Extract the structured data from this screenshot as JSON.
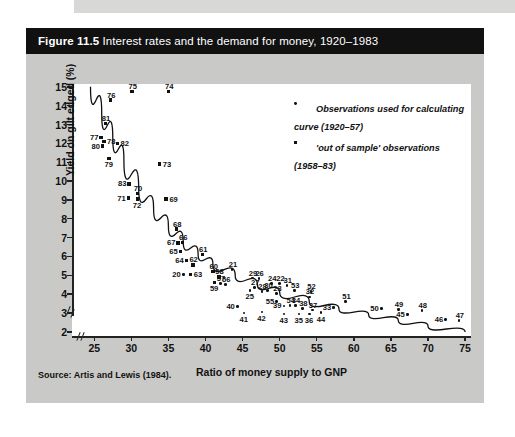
{
  "figure": {
    "number_label": "Figure 11.5",
    "title": "Interest rates and the demand for money, 1920–1983",
    "source": "Source: Artis and Lewis (1984)."
  },
  "legend": {
    "items": [
      {
        "marker": "dot",
        "text": "Observations used for calculating curve (1920–57)"
      },
      {
        "marker": "square",
        "text": "'out of sample' observations (1958–83)"
      }
    ]
  },
  "chart_data": {
    "type": "scatter",
    "title": "Interest rates and the demand for money, 1920–1983",
    "xlabel": "Ratio of money supply to GNP",
    "ylabel": "Yield on gilt edged (%)",
    "xlim": [
      22,
      75
    ],
    "ylim": [
      1.8,
      15
    ],
    "xticks": [
      25,
      30,
      35,
      40,
      45,
      50,
      55,
      60,
      65,
      70,
      75
    ],
    "yticks": [
      2,
      3,
      4,
      5,
      6,
      7,
      8,
      9,
      10,
      11,
      12,
      13,
      14,
      15
    ],
    "grid": false,
    "axis_break_x": true,
    "axis_break_y": true,
    "legend_position": "top-right",
    "series": [
      {
        "name": "Observations used for calculating curve (1920–57)",
        "marker": "dot",
        "points": [
          {
            "label": "20",
            "x": 37.0,
            "y": 5.05
          },
          {
            "label": "21",
            "x": 43.6,
            "y": 5.3
          },
          {
            "label": "22",
            "x": 50.0,
            "y": 4.55
          },
          {
            "label": "23",
            "x": 49.6,
            "y": 4.05
          },
          {
            "label": "24",
            "x": 48.9,
            "y": 4.58
          },
          {
            "label": "25",
            "x": 46.0,
            "y": 4.2
          },
          {
            "label": "26",
            "x": 47.2,
            "y": 4.82
          },
          {
            "label": "27",
            "x": 46.6,
            "y": 4.35
          },
          {
            "label": "28",
            "x": 47.6,
            "y": 4.15
          },
          {
            "label": "29",
            "x": 46.3,
            "y": 4.85
          },
          {
            "label": "30",
            "x": 48.4,
            "y": 4.18
          },
          {
            "label": "31",
            "x": 51.0,
            "y": 4.45
          },
          {
            "label": "32",
            "x": 54.0,
            "y": 3.85
          },
          {
            "label": "33",
            "x": 57.3,
            "y": 3.3
          },
          {
            "label": "34",
            "x": 52.1,
            "y": 3.4
          },
          {
            "label": "35",
            "x": 52.6,
            "y": 2.95
          },
          {
            "label": "36",
            "x": 54.0,
            "y": 2.95
          },
          {
            "label": "37",
            "x": 54.4,
            "y": 3.15
          },
          {
            "label": "38",
            "x": 53.1,
            "y": 3.25
          },
          {
            "label": "39",
            "x": 50.6,
            "y": 3.38
          },
          {
            "label": "40",
            "x": 44.3,
            "y": 3.35
          },
          {
            "label": "41",
            "x": 45.2,
            "y": 3.0
          },
          {
            "label": "42",
            "x": 47.6,
            "y": 3.05
          },
          {
            "label": "43",
            "x": 50.6,
            "y": 2.95
          },
          {
            "label": "44",
            "x": 55.6,
            "y": 3.02
          },
          {
            "label": "45",
            "x": 67.2,
            "y": 2.92
          },
          {
            "label": "46",
            "x": 72.4,
            "y": 2.65
          },
          {
            "label": "47",
            "x": 74.2,
            "y": 2.6
          },
          {
            "label": "48",
            "x": 69.2,
            "y": 3.12
          },
          {
            "label": "49",
            "x": 66.0,
            "y": 3.18
          },
          {
            "label": "50",
            "x": 63.7,
            "y": 3.25
          },
          {
            "label": "51",
            "x": 58.9,
            "y": 3.62
          },
          {
            "label": "52",
            "x": 54.2,
            "y": 4.15
          },
          {
            "label": "53",
            "x": 52.0,
            "y": 4.18
          },
          {
            "label": "54",
            "x": 51.4,
            "y": 3.4
          },
          {
            "label": "55",
            "x": 49.6,
            "y": 3.62
          },
          {
            "label": "56",
            "x": 42.7,
            "y": 4.52
          },
          {
            "label": "57",
            "x": 42.0,
            "y": 4.55
          }
        ]
      },
      {
        "name": "'out of sample' observations (1958–83)",
        "marker": "square",
        "points": [
          {
            "label": "58",
            "x": 41.8,
            "y": 4.92
          },
          {
            "label": "59",
            "x": 41.2,
            "y": 4.62
          },
          {
            "label": "60",
            "x": 41.0,
            "y": 5.2
          },
          {
            "label": "61",
            "x": 39.6,
            "y": 6.1
          },
          {
            "label": "62",
            "x": 38.3,
            "y": 5.55
          },
          {
            "label": "63",
            "x": 38.0,
            "y": 5.05
          },
          {
            "label": "64",
            "x": 37.4,
            "y": 5.8
          },
          {
            "label": "65",
            "x": 36.6,
            "y": 6.25
          },
          {
            "label": "66",
            "x": 36.9,
            "y": 6.75
          },
          {
            "label": "67",
            "x": 36.3,
            "y": 6.72
          },
          {
            "label": "68",
            "x": 36.1,
            "y": 7.45
          },
          {
            "label": "69",
            "x": 34.7,
            "y": 9.05
          },
          {
            "label": "70",
            "x": 30.8,
            "y": 9.35
          },
          {
            "label": "71",
            "x": 29.6,
            "y": 9.1
          },
          {
            "label": "72",
            "x": 30.8,
            "y": 9.05
          },
          {
            "label": "73",
            "x": 33.8,
            "y": 10.9
          },
          {
            "label": "74",
            "x": 35.0,
            "y": 14.75
          },
          {
            "label": "75",
            "x": 30.1,
            "y": 14.75
          },
          {
            "label": "76",
            "x": 27.2,
            "y": 14.3
          },
          {
            "label": "77",
            "x": 25.9,
            "y": 12.3
          },
          {
            "label": "78",
            "x": 26.3,
            "y": 12.1
          },
          {
            "label": "79",
            "x": 27.0,
            "y": 11.2
          },
          {
            "label": "80",
            "x": 26.1,
            "y": 11.85
          },
          {
            "label": "81",
            "x": 26.5,
            "y": 13.05
          },
          {
            "label": "82",
            "x": 28.1,
            "y": 12.0
          },
          {
            "label": "83",
            "x": 29.7,
            "y": 9.85
          }
        ]
      }
    ],
    "fitted_curve": {
      "description": "downward sloping convex demand-for-money curve",
      "points": [
        {
          "x": 24.5,
          "y": 15.0
        },
        {
          "x": 26.0,
          "y": 13.6
        },
        {
          "x": 27.5,
          "y": 12.3
        },
        {
          "x": 29.0,
          "y": 11.1
        },
        {
          "x": 31.0,
          "y": 9.6
        },
        {
          "x": 33.0,
          "y": 8.5
        },
        {
          "x": 35.0,
          "y": 7.6
        },
        {
          "x": 37.0,
          "y": 6.8
        },
        {
          "x": 39.0,
          "y": 6.1
        },
        {
          "x": 41.0,
          "y": 5.6
        },
        {
          "x": 44.0,
          "y": 5.0
        },
        {
          "x": 47.0,
          "y": 4.5
        },
        {
          "x": 50.0,
          "y": 4.1
        },
        {
          "x": 54.0,
          "y": 3.6
        },
        {
          "x": 58.0,
          "y": 3.2
        },
        {
          "x": 62.0,
          "y": 2.9
        },
        {
          "x": 66.0,
          "y": 2.6
        },
        {
          "x": 70.0,
          "y": 2.3
        },
        {
          "x": 75.0,
          "y": 2.0
        }
      ]
    }
  }
}
